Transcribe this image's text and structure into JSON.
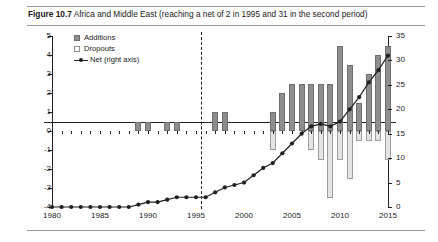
{
  "figure": {
    "label": "Figure 10.7",
    "caption": "Africa and Middle East (reaching a net of 2 in 1995 and 31 in the second period)"
  },
  "legend": {
    "position": "top-left",
    "items": [
      {
        "key": "additions",
        "label": "Additions",
        "icon": "filled-square-swatch",
        "color": "#8e8e8e"
      },
      {
        "key": "dropouts",
        "label": "Dropouts",
        "icon": "hollow-square-swatch",
        "color": "#ffffff"
      },
      {
        "key": "net",
        "label": "Net (right axis)",
        "icon": "line-with-marker",
        "color": "#231f20"
      }
    ]
  },
  "chart_data": {
    "type": "bar",
    "title": "Africa and Middle East (reaching a net of 2 in 1995 and 31 in the second period)",
    "xlabel": "",
    "ylabel": "",
    "grid": false,
    "legend_position": "top-left",
    "x": [
      1980,
      1981,
      1982,
      1983,
      1984,
      1985,
      1986,
      1987,
      1988,
      1989,
      1990,
      1991,
      1992,
      1993,
      1994,
      1995,
      1996,
      1997,
      1998,
      1999,
      2000,
      2001,
      2002,
      2003,
      2004,
      2005,
      2006,
      2007,
      2008,
      2009,
      2010,
      2011,
      2012,
      2013,
      2014,
      2015
    ],
    "xtick_labels": [
      "1980",
      "1985",
      "1990",
      "1995",
      "2000",
      "2005",
      "2010",
      "2015"
    ],
    "xticks": [
      1980,
      1985,
      1990,
      1995,
      2000,
      2005,
      2010,
      2015
    ],
    "left_axis": {
      "ylim": [
        -4,
        5
      ],
      "ticks": [
        -4,
        -3,
        -2,
        -1,
        0,
        1,
        2,
        3,
        4,
        5
      ],
      "tick_labels": [
        "-4",
        "-3",
        "-2",
        "-1",
        "0",
        "1",
        "2",
        "3",
        "4",
        "5"
      ]
    },
    "right_axis": {
      "ylim": [
        0,
        35
      ],
      "ticks": [
        0,
        5,
        10,
        15,
        20,
        25,
        30,
        35
      ],
      "tick_labels": [
        "0",
        "5",
        "10",
        "15",
        "20",
        "25",
        "30",
        "35"
      ]
    },
    "series": [
      {
        "name": "Additions",
        "axis": "left",
        "type": "bar",
        "color": "#8e8e8e",
        "values": [
          0,
          0,
          0,
          0,
          0,
          0,
          0,
          0,
          0,
          0.5,
          0.5,
          0,
          0.5,
          0.5,
          0,
          0,
          0,
          1,
          1,
          0,
          0,
          0,
          0,
          1,
          2,
          2.5,
          2.5,
          2.5,
          2.5,
          2.5,
          4.5,
          3.5,
          1.5,
          3,
          4,
          4.5
        ]
      },
      {
        "name": "Dropouts",
        "axis": "left",
        "type": "bar",
        "color": "#e4e4e4",
        "values": [
          0,
          0,
          0,
          0,
          0,
          0,
          0,
          0,
          0,
          0,
          0,
          0,
          0,
          0,
          0,
          0,
          0,
          0,
          0,
          0,
          0,
          0,
          0,
          -1,
          0,
          0,
          0,
          -1,
          -1.5,
          -3.5,
          -1.5,
          -2.5,
          -0.5,
          -0.5,
          -0.5,
          -1.5
        ]
      },
      {
        "name": "Net (right axis)",
        "axis": "right",
        "type": "line",
        "color": "#231f20",
        "values": [
          0,
          0,
          0,
          0,
          0,
          0,
          0,
          0,
          0,
          0.5,
          1,
          1,
          1.5,
          2,
          2,
          2,
          2,
          3,
          4,
          4.5,
          5,
          6.5,
          8,
          9,
          11,
          13,
          15,
          16.5,
          17,
          16.5,
          17.5,
          20,
          22.5,
          25.5,
          28,
          31
        ]
      }
    ],
    "annotations": [
      {
        "type": "vertical-dashed-line",
        "name": "period-break",
        "x": 1995.5
      }
    ]
  }
}
